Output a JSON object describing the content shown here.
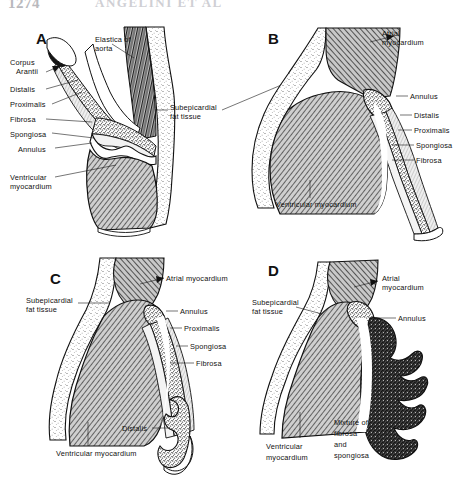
{
  "figure": {
    "type": "anatomical-illustration",
    "style": "black-and-white line drawing with stipple and hatch textures",
    "background_color": "#ffffff",
    "ink_color": "#111111",
    "header": {
      "page_number": "1274",
      "running_title": "ANGELINI ET AL",
      "note": "partially cropped / faded at top edge"
    },
    "panel_count": 4
  },
  "legend_terms": [
    "Elastica of aorta",
    "Corpus Arantii",
    "Distalis",
    "Proximalis",
    "Fibrosa",
    "Spongiosa",
    "Annulus",
    "Subepicardial fat tissue",
    "Ventricular myocardium",
    "Atrial myocardium",
    "Mixture of fibrosa and spongiosa"
  ],
  "panels": [
    {
      "id": "A",
      "letter": "A",
      "position": "top-left",
      "labels": [
        {
          "name": "elastica-of-aorta",
          "text": "Elastica of\naorta",
          "lines": [
            "Elastica  of",
            "aorta"
          ],
          "side": "top"
        },
        {
          "name": "corpus-arantii",
          "text": "Corpus\nArantii",
          "lines": [
            "Corpus",
            "Arantii"
          ],
          "side": "left"
        },
        {
          "name": "distalis",
          "text": "Distalis",
          "lines": [
            "Distalis"
          ],
          "side": "left"
        },
        {
          "name": "proximalis",
          "text": "Proximalis",
          "lines": [
            "Proximalis"
          ],
          "side": "left"
        },
        {
          "name": "fibrosa",
          "text": "Fibrosa",
          "lines": [
            "Fibrosa"
          ],
          "side": "left"
        },
        {
          "name": "spongiosa",
          "text": "Spongiosa",
          "lines": [
            "Spongiosa"
          ],
          "side": "left"
        },
        {
          "name": "annulus",
          "text": "Annulus",
          "lines": [
            "Annulus"
          ],
          "side": "left"
        },
        {
          "name": "ventricular-myocardium",
          "text": "Ventricular\nmyocardium",
          "lines": [
            "Ventricular",
            "myocardium"
          ],
          "side": "left"
        },
        {
          "name": "subepicardial-fat-tissue",
          "text": "Subepicardial\nfat tissue",
          "lines": [
            "Subepicardial",
            "fat tissue"
          ],
          "side": "right"
        }
      ]
    },
    {
      "id": "B",
      "letter": "B",
      "position": "top-right",
      "labels": [
        {
          "name": "atrial-myocardium",
          "text": "Atrial\nmyocardium",
          "lines": [
            "Atrial",
            "myocardium"
          ],
          "side": "right"
        },
        {
          "name": "annulus",
          "text": "Annulus",
          "lines": [
            "Annulus"
          ],
          "side": "right"
        },
        {
          "name": "distalis",
          "text": "Distalis",
          "lines": [
            "Distalis"
          ],
          "side": "right"
        },
        {
          "name": "proximalis",
          "text": "Proximalis",
          "lines": [
            "Proximalis"
          ],
          "side": "right"
        },
        {
          "name": "spongiosa",
          "text": "Spongiosa",
          "lines": [
            "Spongiosa"
          ],
          "side": "right"
        },
        {
          "name": "fibrosa",
          "text": "Fibrosa",
          "lines": [
            "Fibrosa"
          ],
          "side": "right"
        },
        {
          "name": "ventricular-myocardium",
          "text": "Ventricular myocardium",
          "lines": [
            "Ventricular  myocardium"
          ],
          "side": "bottom"
        }
      ]
    },
    {
      "id": "C",
      "letter": "C",
      "position": "bottom-left",
      "labels": [
        {
          "name": "atrial-myocardium",
          "text": "Atrial myocardium",
          "lines": [
            "Atrial  myocardium"
          ],
          "side": "right"
        },
        {
          "name": "subepicardial-fat-tissue",
          "text": "Subepicardial\nfat tissue",
          "lines": [
            "Subepicardial",
            "fat tissue"
          ],
          "side": "left"
        },
        {
          "name": "annulus",
          "text": "Annulus",
          "lines": [
            "Annulus"
          ],
          "side": "right"
        },
        {
          "name": "proximalis",
          "text": "Proximalis",
          "lines": [
            "Proximalis"
          ],
          "side": "right"
        },
        {
          "name": "spongiosa",
          "text": "Spongiosa",
          "lines": [
            "Spongiosa"
          ],
          "side": "right"
        },
        {
          "name": "fibrosa",
          "text": "Fibrosa",
          "lines": [
            "Fibrosa"
          ],
          "side": "right"
        },
        {
          "name": "distalis",
          "text": "Distalis",
          "lines": [
            "Distalis"
          ],
          "side": "right"
        },
        {
          "name": "ventricular-myocardium",
          "text": "Ventricular myocardium",
          "lines": [
            "Ventricular  myocardium"
          ],
          "side": "bottom"
        }
      ]
    },
    {
      "id": "D",
      "letter": "D",
      "position": "bottom-right",
      "labels": [
        {
          "name": "atrial-myocardium",
          "text": "Atrial\nmyocardium",
          "lines": [
            "Atrial",
            "myocardium"
          ],
          "side": "right"
        },
        {
          "name": "subepicardial-fat-tissue",
          "text": "Subepicardial\nfat tissue",
          "lines": [
            "Subepicardial",
            "fat tissue"
          ],
          "side": "left"
        },
        {
          "name": "annulus",
          "text": "Annulus",
          "lines": [
            "Annulus"
          ],
          "side": "right"
        },
        {
          "name": "mixture-of-fibrosa-and-spongiosa",
          "text": "Mixture of\nfibrosa\nand\nspongiosa",
          "lines": [
            "Mixture  of",
            "fibrosa",
            "and",
            "spongiosa"
          ],
          "side": "bottom"
        },
        {
          "name": "ventricular-myocardium",
          "text": "Ventricular\nmyocardium",
          "lines": [
            "Ventricular",
            "myocardium"
          ],
          "side": "bottom"
        }
      ]
    }
  ]
}
